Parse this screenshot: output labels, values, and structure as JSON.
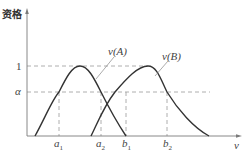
{
  "diagram": {
    "y_axis_label": "资格",
    "x_axis_label": "ν",
    "y_ticks": [
      {
        "label": "1",
        "value": 1
      },
      {
        "label": "α",
        "value": "alpha"
      }
    ],
    "x_ticks": [
      {
        "base": "a",
        "sub": "1"
      },
      {
        "base": "a",
        "sub": "2"
      },
      {
        "base": "b",
        "sub": "1"
      },
      {
        "base": "b",
        "sub": "2"
      }
    ],
    "curves": [
      {
        "label": "ν(A)",
        "note": "bell curve peaking at 1, crosses α at a1 and b1"
      },
      {
        "label": "ν(B)",
        "note": "bell curve peaking at 1, crosses α at a2 and b2"
      }
    ],
    "colors": {
      "axis": "#7a7a7a",
      "curve": "#333333",
      "dashed": "#999999",
      "text": "#444444"
    }
  }
}
